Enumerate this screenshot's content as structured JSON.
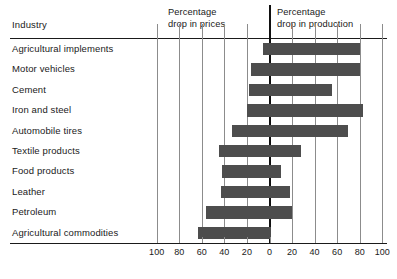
{
  "table": {
    "industry_header": "Industry"
  },
  "headers": {
    "left": {
      "line1": "Percentage",
      "line2": "drop in prices"
    },
    "right": {
      "line1": "Percentage",
      "line2": "drop in production"
    }
  },
  "colors": {
    "bar": "#4d4d4d",
    "zero_line": "#111111",
    "gridline": "#8c8c8c",
    "rule": "#1a1a1a",
    "background": "#ffffff",
    "text": "#1a1a1a"
  },
  "chart_data": {
    "type": "bar",
    "orientation": "horizontal",
    "title": "",
    "subtitle": "",
    "xlabel": "",
    "ylabel": "Industry",
    "xlim": [
      -100,
      100
    ],
    "grid": true,
    "legend_position": "top",
    "axis_note": "Diverging axis: values left of 0 are percentage drop in prices; values right of 0 are percentage drop in production.",
    "tick_values": [
      -100,
      -80,
      -60,
      -40,
      -20,
      0,
      20,
      40,
      60,
      80,
      100
    ],
    "tick_labels": [
      "100",
      "80",
      "60",
      "40",
      "20",
      "0",
      "20",
      "40",
      "60",
      "80",
      "100"
    ],
    "categories": [
      "Agricultural implements",
      "Motor vehicles",
      "Cement",
      "Iron and steel",
      "Automobile tires",
      "Textile products",
      "Food products",
      "Leather",
      "Petroleum",
      "Agricultural commodities"
    ],
    "series": [
      {
        "name": "Percentage drop in prices",
        "values": [
          6,
          16,
          18,
          20,
          33,
          45,
          42,
          43,
          56,
          63
        ]
      },
      {
        "name": "Percentage drop in production",
        "values": [
          80,
          80,
          55,
          83,
          70,
          28,
          10,
          18,
          20,
          1
        ]
      }
    ],
    "spans": [
      {
        "category": "Agricultural implements",
        "price_drop": 6,
        "production_drop": 80
      },
      {
        "category": "Motor vehicles",
        "price_drop": 16,
        "production_drop": 80
      },
      {
        "category": "Cement",
        "price_drop": 18,
        "production_drop": 55
      },
      {
        "category": "Iron and steel",
        "price_drop": 20,
        "production_drop": 83
      },
      {
        "category": "Automobile tires",
        "price_drop": 33,
        "production_drop": 70
      },
      {
        "category": "Textile products",
        "price_drop": 45,
        "production_drop": 28
      },
      {
        "category": "Food products",
        "price_drop": 42,
        "production_drop": 10
      },
      {
        "category": "Leather",
        "price_drop": 43,
        "production_drop": 18
      },
      {
        "category": "Petroleum",
        "price_drop": 56,
        "production_drop": 20
      },
      {
        "category": "Agricultural commodities",
        "price_drop": 63,
        "production_drop": 1
      }
    ]
  }
}
